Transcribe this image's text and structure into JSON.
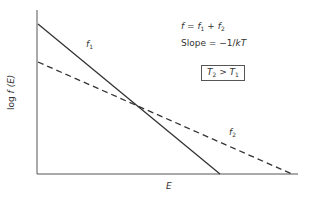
{
  "diagram": {
    "x_axis_label": "E",
    "y_axis_label_prefix": "log ",
    "y_axis_label_f": "f",
    "y_axis_label_suffix": " (E)",
    "curves": [
      {
        "name": "f1",
        "label_base": "f",
        "label_sub": "1",
        "style": "solid"
      },
      {
        "name": "f2",
        "label_base": "f",
        "label_sub": "2",
        "style": "dashed"
      }
    ],
    "equation": {
      "lhs": "f",
      "eq": " = ",
      "t1": "f",
      "t1_sub": "1",
      "plus": " + ",
      "t2": "f",
      "t2_sub": "2"
    },
    "slope": {
      "prefix": "Slope = −1/",
      "kt": "kT"
    },
    "condition": {
      "a": "T",
      "a_sub": "2",
      "op": " > ",
      "b": "T",
      "b_sub": "1"
    },
    "colors": {
      "line": "#333333",
      "axis": "#555555"
    }
  }
}
